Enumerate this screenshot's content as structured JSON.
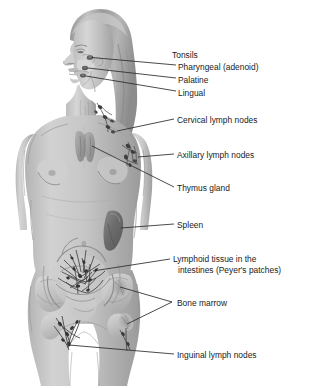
{
  "diagram": {
    "background_color": "#ffffff",
    "colors": {
      "body_fill": "#c3c3c3",
      "body_shadow": "#9d9d9d",
      "body_highlight": "#dcdcdc",
      "hair": "#9a9a9a",
      "hair_highlight": "#c8c8c8",
      "spleen": "#6e6e6e",
      "thymus": "#a0a0a0",
      "lymph_node": "#4a4a4a",
      "vessel": "#3c3c3c",
      "bone": "#cfcfcf",
      "leader_line": "#2b2b2b",
      "text": "#1a1a1a"
    }
  },
  "labels": [
    {
      "id": "tonsils",
      "text": "Tonsils",
      "is_group_heading": true,
      "has_leader": false,
      "x": 172,
      "y": 55
    },
    {
      "id": "pharyngeal-adenoid",
      "text": "Pharyngeal (adenoid)",
      "is_group_heading": false,
      "has_leader": true,
      "x": 178,
      "y": 68
    },
    {
      "id": "palatine",
      "text": "Palatine",
      "is_group_heading": false,
      "has_leader": true,
      "x": 178,
      "y": 81
    },
    {
      "id": "lingual",
      "text": "Lingual",
      "is_group_heading": false,
      "has_leader": true,
      "x": 178,
      "y": 94
    },
    {
      "id": "cervical-lymph-nodes",
      "text": "Cervical lymph nodes",
      "is_group_heading": false,
      "has_leader": true,
      "x": 176,
      "y": 122
    },
    {
      "id": "axillary-lymph-nodes",
      "text": "Axillary lymph nodes",
      "is_group_heading": false,
      "has_leader": true,
      "x": 176,
      "y": 157
    },
    {
      "id": "thymus-gland",
      "text": "Thymus gland",
      "is_group_heading": false,
      "has_leader": true,
      "x": 176,
      "y": 190
    },
    {
      "id": "spleen",
      "text": "Spleen",
      "is_group_heading": false,
      "has_leader": true,
      "x": 176,
      "y": 227
    },
    {
      "id": "lymphoid-tissue-intestines",
      "text": "Lymphoid tissue in the intestines (Peyer's patches)",
      "line1": "Lymphoid tissue in the",
      "line2": "intestines (Peyer's patches)",
      "is_group_heading": false,
      "has_leader": true,
      "x": 172,
      "y": 262
    },
    {
      "id": "bone-marrow",
      "text": "Bone marrow",
      "is_group_heading": false,
      "has_leader": true,
      "x": 176,
      "y": 303
    },
    {
      "id": "inguinal-lymph-nodes",
      "text": "Inguinal lymph nodes",
      "is_group_heading": false,
      "has_leader": true,
      "x": 176,
      "y": 357
    }
  ],
  "structures": [
    {
      "id": "pharyngeal-tonsil",
      "label": "Pharyngeal (adenoid) tonsil",
      "region": "nasopharynx"
    },
    {
      "id": "palatine-tonsil",
      "label": "Palatine tonsil",
      "region": "oropharynx"
    },
    {
      "id": "lingual-tonsil",
      "label": "Lingual tonsil",
      "region": "tongue-base"
    },
    {
      "id": "cervical-nodes",
      "label": "Cervical lymph nodes",
      "region": "neck"
    },
    {
      "id": "axillary-nodes",
      "label": "Axillary lymph nodes",
      "region": "armpit"
    },
    {
      "id": "thymus",
      "label": "Thymus gland",
      "region": "upper-chest"
    },
    {
      "id": "spleen",
      "label": "Spleen",
      "region": "left-upper-abdomen"
    },
    {
      "id": "peyers-patches",
      "label": "Peyer's patches",
      "region": "intestines"
    },
    {
      "id": "bone-marrow",
      "label": "Bone marrow",
      "region": "pelvis-and-femur"
    },
    {
      "id": "inguinal-nodes",
      "label": "Inguinal lymph nodes",
      "region": "groin"
    }
  ]
}
